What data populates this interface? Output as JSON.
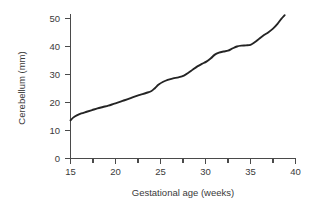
{
  "chart_data": {
    "type": "line",
    "title": "",
    "subtitle": "",
    "xlabel": "Gestational age (weeks)",
    "ylabel": "Cerebellum (mm)",
    "xlim": [
      15,
      40
    ],
    "ylim": [
      0,
      52
    ],
    "grid": false,
    "legend": false,
    "legend_position": "none",
    "x_ticks_major": [
      15,
      20,
      25,
      30,
      35,
      40
    ],
    "x_tick_labels": [
      "15",
      "20",
      "25",
      "30",
      "35",
      "40"
    ],
    "x_ticks_minor": [
      16,
      17,
      18,
      19,
      21,
      22,
      23,
      24,
      26,
      27,
      28,
      29,
      31,
      32,
      33,
      34,
      36,
      37,
      38,
      39
    ],
    "y_ticks_major": [
      0,
      10,
      20,
      30,
      40,
      50
    ],
    "y_tick_labels": [
      "0",
      "10",
      "20",
      "30",
      "40",
      "50"
    ],
    "series": [
      {
        "name": "Cerebellum transverse diameter",
        "color": "#242424",
        "x": [
          15.0,
          15.3,
          15.7,
          16.2,
          16.8,
          17.4,
          18.0,
          18.6,
          19.2,
          19.8,
          20.4,
          21.0,
          21.6,
          22.2,
          22.8,
          23.4,
          24.0,
          24.4,
          24.8,
          25.3,
          25.8,
          26.4,
          27.0,
          27.6,
          28.1,
          28.6,
          29.1,
          29.6,
          30.1,
          30.6,
          31.0,
          31.5,
          32.0,
          32.5,
          33.0,
          33.5,
          34.0,
          34.5,
          35.0,
          35.5,
          36.0,
          36.5,
          37.0,
          37.5,
          38.0,
          38.4,
          38.8
        ],
        "y": [
          13.6,
          14.6,
          15.4,
          16.1,
          16.7,
          17.3,
          17.9,
          18.4,
          18.9,
          19.5,
          20.1,
          20.8,
          21.5,
          22.2,
          22.8,
          23.4,
          24.1,
          25.2,
          26.4,
          27.4,
          28.1,
          28.6,
          29.0,
          29.6,
          30.6,
          31.8,
          32.9,
          33.8,
          34.6,
          35.8,
          37.0,
          37.8,
          38.2,
          38.5,
          39.3,
          40.0,
          40.3,
          40.4,
          40.6,
          41.6,
          42.9,
          44.1,
          45.1,
          46.4,
          48.1,
          49.8,
          51.2
        ]
      }
    ]
  },
  "axes": {
    "x_axis_name": "gestational-age-axis",
    "y_axis_name": "cerebellum-axis"
  }
}
